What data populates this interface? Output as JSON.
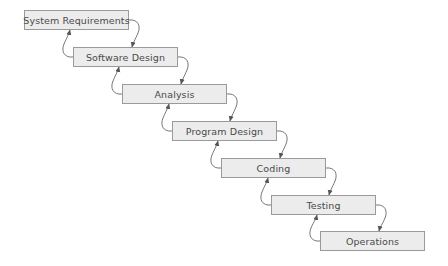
{
  "diagram": {
    "type": "waterfall",
    "stages": [
      {
        "label": "System Requirements",
        "x": 24,
        "y": 10,
        "w": 105,
        "h": 20
      },
      {
        "label": "Software Design",
        "x": 73,
        "y": 47,
        "w": 105,
        "h": 20
      },
      {
        "label": "Analysis",
        "x": 122,
        "y": 84,
        "w": 105,
        "h": 20
      },
      {
        "label": "Program Design",
        "x": 172,
        "y": 121,
        "w": 105,
        "h": 20
      },
      {
        "label": "Coding",
        "x": 221,
        "y": 158,
        "w": 105,
        "h": 20
      },
      {
        "label": "Testing",
        "x": 271,
        "y": 195,
        "w": 105,
        "h": 20
      },
      {
        "label": "Operations",
        "x": 320,
        "y": 231,
        "w": 105,
        "h": 20
      }
    ],
    "connections": "each stage has a forward arrow to the next stage and a feedback arrow back to the previous stage",
    "colors": {
      "box_fill": "#ececec",
      "box_border": "#9a9a9a",
      "text": "#4a4a4a",
      "arrow": "#555555"
    }
  }
}
